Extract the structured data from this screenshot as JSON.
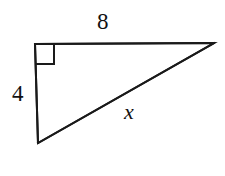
{
  "figure": {
    "kind": "right-triangle-diagram",
    "background_color": "#ffffff",
    "stroke_color": "#1a1a1a",
    "stroke_width": 2,
    "vertices": {
      "right_angle_corner": {
        "x": 35,
        "y": 44
      },
      "top_right_apex": {
        "x": 214,
        "y": 43
      },
      "bottom_left": {
        "x": 38,
        "y": 143
      }
    },
    "right_angle_marker": {
      "present": true,
      "size": 19,
      "origin": {
        "x": 35,
        "y": 45
      }
    },
    "labels": {
      "top_side": "8",
      "left_side": "4",
      "hypotenuse": "x"
    }
  },
  "chart_data": {
    "type": "diagram",
    "title": "",
    "shape": "right triangle",
    "sides": [
      {
        "name": "top_leg",
        "label": "8",
        "value": 8,
        "from": "right_angle_corner",
        "to": "top_right_apex"
      },
      {
        "name": "left_leg",
        "label": "4",
        "value": 4,
        "from": "right_angle_corner",
        "to": "bottom_left"
      },
      {
        "name": "hypotenuse",
        "label": "x",
        "value": null,
        "from": "bottom_left",
        "to": "top_right_apex"
      }
    ],
    "angles": [
      {
        "at": "right_angle_corner",
        "measure": 90,
        "marked": true
      }
    ]
  }
}
